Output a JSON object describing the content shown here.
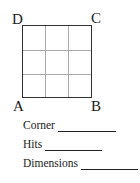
{
  "diagram": {
    "corners": {
      "top_left": "D",
      "top_right": "C",
      "bottom_left": "A",
      "bottom_right": "B"
    },
    "grid": {
      "rows": 3,
      "cols": 3
    }
  },
  "fields": [
    {
      "label": "Corner",
      "value": ""
    },
    {
      "label": "Hits",
      "value": ""
    },
    {
      "label": "Dimensions",
      "value": ""
    }
  ]
}
